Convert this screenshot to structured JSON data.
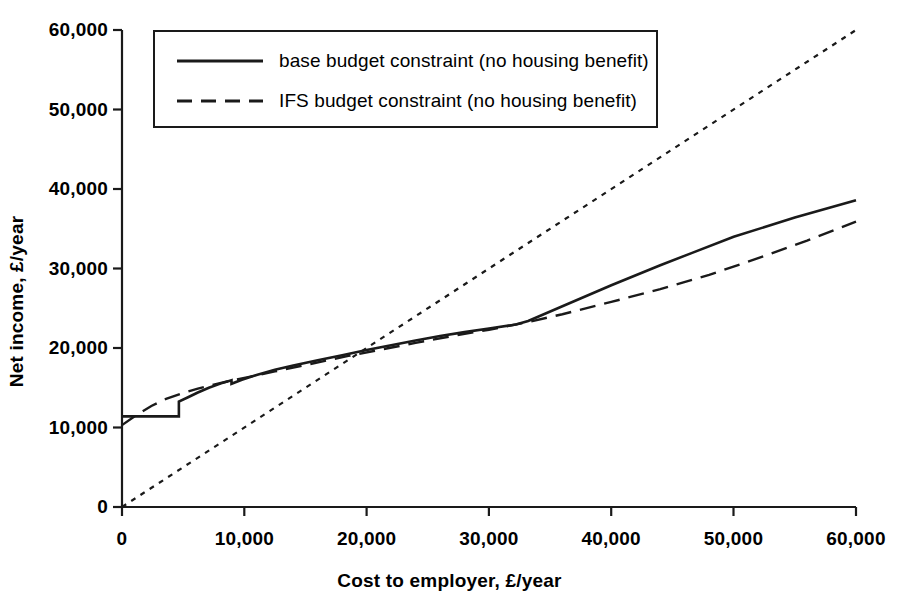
{
  "chart_data": {
    "type": "line",
    "title": "",
    "xlabel": "Cost to employer, £/year",
    "ylabel": "Net income, £/year",
    "xlim": [
      0,
      60000
    ],
    "ylim": [
      0,
      60000
    ],
    "xticks": [
      "0",
      "10,000",
      "20,000",
      "30,000",
      "40,000",
      "50,000",
      "60,000"
    ],
    "xtick_values": [
      0,
      10000,
      20000,
      30000,
      40000,
      50000,
      60000
    ],
    "yticks": [
      "0",
      "10,000",
      "20,000",
      "30,000",
      "40,000",
      "50,000",
      "60,000"
    ],
    "ytick_values": [
      0,
      10000,
      20000,
      30000,
      40000,
      50000,
      60000
    ],
    "grid": false,
    "legend_position": "top-left",
    "line_color": "#1a1a1a",
    "series": [
      {
        "name": "base budget constraint (no housing benefit)",
        "style": "solid",
        "points": [
          [
            0,
            11400
          ],
          [
            4650,
            11400
          ],
          [
            4650,
            13250
          ],
          [
            5400,
            13800
          ],
          [
            6200,
            14400
          ],
          [
            7100,
            15000
          ],
          [
            8100,
            15550
          ],
          [
            8950,
            15950
          ],
          [
            8950,
            15500
          ],
          [
            9800,
            16000
          ],
          [
            11000,
            16600
          ],
          [
            12500,
            17250
          ],
          [
            14000,
            17800
          ],
          [
            16000,
            18450
          ],
          [
            18000,
            19100
          ],
          [
            20000,
            19750
          ],
          [
            22000,
            20350
          ],
          [
            24000,
            20950
          ],
          [
            26000,
            21500
          ],
          [
            28000,
            22000
          ],
          [
            30000,
            22450
          ],
          [
            32200,
            22950
          ],
          [
            33200,
            23400
          ],
          [
            36000,
            25250
          ],
          [
            40000,
            27900
          ],
          [
            44000,
            30400
          ],
          [
            46500,
            31900
          ],
          [
            50000,
            34000
          ],
          [
            55000,
            36400
          ],
          [
            60000,
            38600
          ]
        ]
      },
      {
        "name": "IFS budget constraint (no housing benefit)",
        "style": "dashed",
        "points": [
          [
            0,
            10300
          ],
          [
            1200,
            11600
          ],
          [
            2400,
            12700
          ],
          [
            3600,
            13600
          ],
          [
            4900,
            14300
          ],
          [
            6200,
            14900
          ],
          [
            7500,
            15400
          ],
          [
            8900,
            15900
          ],
          [
            10500,
            16400
          ],
          [
            12500,
            17050
          ],
          [
            14500,
            17700
          ],
          [
            16500,
            18350
          ],
          [
            18500,
            19000
          ],
          [
            21000,
            19750
          ],
          [
            24000,
            20650
          ],
          [
            27000,
            21500
          ],
          [
            30000,
            22300
          ],
          [
            33000,
            23200
          ],
          [
            36000,
            24250
          ],
          [
            40000,
            25800
          ],
          [
            44000,
            27400
          ],
          [
            48000,
            29200
          ],
          [
            52000,
            31300
          ],
          [
            56000,
            33500
          ],
          [
            60000,
            35900
          ]
        ]
      },
      {
        "name": "45-degree reference line",
        "style": "dotted",
        "points": [
          [
            0,
            0
          ],
          [
            60000,
            60000
          ]
        ]
      }
    ]
  },
  "legend": {
    "entries": [
      {
        "label": "base budget constraint (no housing benefit)",
        "style": "solid"
      },
      {
        "label": "IFS budget constraint (no housing benefit)",
        "style": "dashed"
      }
    ]
  },
  "axes": {
    "x_title": "Cost to employer, £/year",
    "y_title": "Net income, £/year",
    "x_labels": [
      "0",
      "10,000",
      "20,000",
      "30,000",
      "40,000",
      "50,000",
      "60,000"
    ],
    "y_labels": [
      "0",
      "10,000",
      "20,000",
      "30,000",
      "40,000",
      "50,000",
      "60,000"
    ]
  }
}
